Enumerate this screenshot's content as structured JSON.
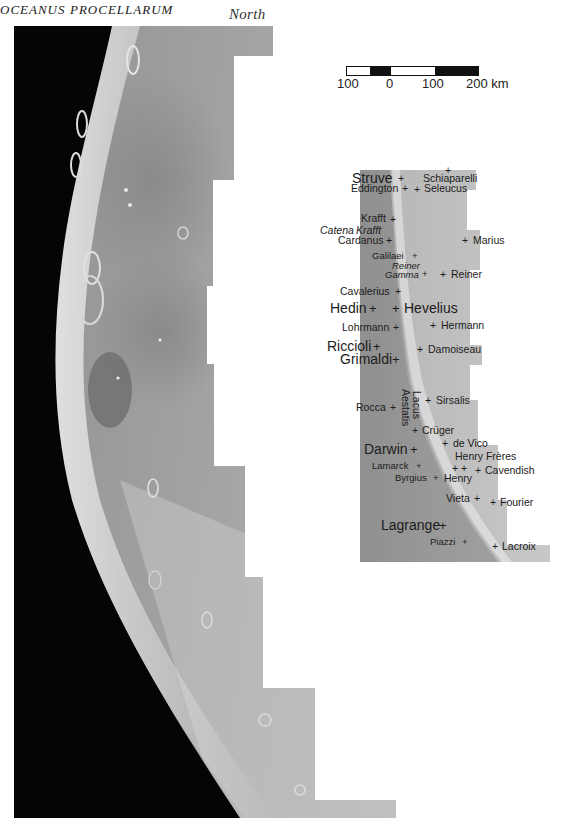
{
  "figure": {
    "orientation_label": "North",
    "scale_bar": {
      "ticks": [
        "100",
        "0",
        "100",
        "200 km"
      ],
      "segments": [
        "white",
        "black",
        "white",
        "black"
      ]
    }
  },
  "map_labels": {
    "craters": [
      {
        "name": "Struve",
        "size": "large"
      },
      {
        "name": "Schiaparelli",
        "size": "medium"
      },
      {
        "name": "Eddington",
        "size": "medium"
      },
      {
        "name": "Seleucus",
        "size": "medium"
      },
      {
        "name": "Krafft",
        "size": "medium"
      },
      {
        "name": "Cardanus",
        "size": "medium"
      },
      {
        "name": "Marius",
        "size": "medium"
      },
      {
        "name": "Galilaei",
        "size": "small"
      },
      {
        "name": "Reiner",
        "size": "medium"
      },
      {
        "name": "Cavalerius",
        "size": "medium"
      },
      {
        "name": "Hedin",
        "size": "large"
      },
      {
        "name": "Hevelius",
        "size": "large"
      },
      {
        "name": "Lohrmann",
        "size": "medium"
      },
      {
        "name": "Hermann",
        "size": "medium"
      },
      {
        "name": "Riccioli",
        "size": "large"
      },
      {
        "name": "Grimaldi",
        "size": "large"
      },
      {
        "name": "Damoiseau",
        "size": "medium"
      },
      {
        "name": "Sirsalis",
        "size": "medium"
      },
      {
        "name": "Rocca",
        "size": "medium"
      },
      {
        "name": "Crüger",
        "size": "medium"
      },
      {
        "name": "Darwin",
        "size": "large"
      },
      {
        "name": "de Vico",
        "size": "medium"
      },
      {
        "name": "Henry Frères",
        "size": "medium"
      },
      {
        "name": "Lamarck",
        "size": "small"
      },
      {
        "name": "Cavendish",
        "size": "medium"
      },
      {
        "name": "Byrgius",
        "size": "small"
      },
      {
        "name": "Henry",
        "size": "medium"
      },
      {
        "name": "Vieta",
        "size": "medium"
      },
      {
        "name": "Fourier",
        "size": "medium"
      },
      {
        "name": "Lagrange",
        "size": "large"
      },
      {
        "name": "Piazzi",
        "size": "small"
      },
      {
        "name": "Lacroix",
        "size": "medium"
      }
    ],
    "features": [
      {
        "name": "Catena Krafft",
        "line1": "Catena",
        "line2": "Krafft"
      },
      {
        "name": "Reiner Gamma",
        "line1": "Reiner",
        "line2": "Gamma"
      },
      {
        "name": "Lacus Aestatis",
        "line1": "Lacus",
        "line2": "Aestatis"
      }
    ],
    "regions": [
      {
        "name": "OCEANUS"
      },
      {
        "name": "PROCELLARUM"
      }
    ],
    "marker_symbol": "+"
  },
  "colors": {
    "background": "#ffffff",
    "space": "#050505",
    "highland": "#b9b9b9",
    "mare": "#9a9a9a",
    "label_text": "#1c1c1c"
  }
}
